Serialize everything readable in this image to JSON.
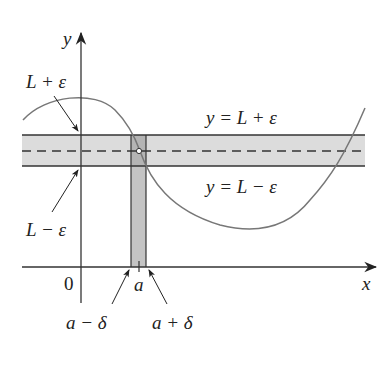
{
  "diagram": {
    "axes": {
      "y_label": "y",
      "x_label": "x",
      "origin_label": "0"
    },
    "band_labels": {
      "upper_left": "L + ε",
      "lower_left": "L − ε",
      "upper_right": "y = L + ε",
      "lower_right": "y = L − ε"
    },
    "x_labels": {
      "a": "a",
      "a_minus_delta": "a − δ",
      "a_plus_delta": "a + δ"
    },
    "colors": {
      "band_fill": "#dcdcdc",
      "strip_fill": "#c4c4c4",
      "curve": "#777777",
      "lines": "#333333"
    }
  }
}
